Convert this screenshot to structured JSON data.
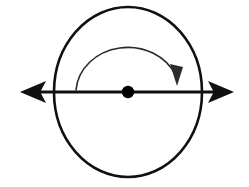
{
  "figure": {
    "background_color": "#ffffff",
    "stroke_color": "#000000",
    "width": 249,
    "height": 187
  },
  "sphere": {
    "name": "sphere-outline",
    "center_x": 128,
    "center_y": 92,
    "radius_x": 74,
    "radius_y": 85,
    "stroke_color": "#111111",
    "stroke_width": 2.6
  },
  "axis": {
    "name": "rotation-axis",
    "label": "",
    "x_start": 24,
    "x_end": 230,
    "y": 92,
    "stroke_color": "#111111",
    "stroke_width": 3.0,
    "left_arrow": {
      "name": "left-arrowhead",
      "tip_x": 20,
      "tip_y": 92,
      "length": 26,
      "half_width": 11
    },
    "right_arrow": {
      "name": "right-arrowhead",
      "tip_x": 234,
      "tip_y": 92,
      "length": 26,
      "half_width": 11
    }
  },
  "center_point": {
    "name": "center-dot",
    "cx": 128,
    "cy": 92,
    "r": 6.2,
    "fill": "#000000"
  },
  "rotation_indicator": {
    "name": "rotation-arc",
    "direction": "clockwise",
    "path": "M 76 90 A 52 46 0 0 1 176 76",
    "stroke_color": "#2b2b2b",
    "stroke_width": 1.6,
    "head": {
      "name": "rotation-arrowhead",
      "tip_x": 177,
      "tip_y": 86,
      "points": "177,86 170,64 183,67"
    }
  }
}
